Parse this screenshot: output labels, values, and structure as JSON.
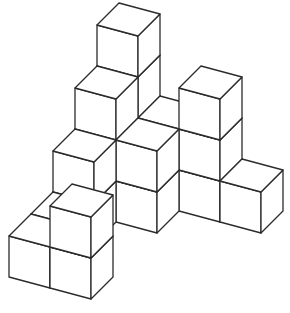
{
  "figure": {
    "title": "Isometric stack of unit cubes",
    "colors": {
      "face_fill": "#ffffff",
      "edge_stroke": "#2b2b2b",
      "background": "#ffffff"
    },
    "projection": {
      "origin": [
        9,
        277
      ],
      "ex": [
        41,
        11
      ],
      "ey": [
        22,
        -22
      ],
      "ez": [
        0,
        -41
      ]
    },
    "columns": [
      {
        "x": 0,
        "y": 4,
        "height": 4
      },
      {
        "x": 1,
        "y": 4,
        "height": 2
      },
      {
        "x": 2,
        "y": 4,
        "height": 3
      },
      {
        "x": 3,
        "y": 4,
        "height": 1
      },
      {
        "x": 0,
        "y": 3,
        "height": 3
      },
      {
        "x": 1,
        "y": 3,
        "height": 2
      },
      {
        "x": 0,
        "y": 2,
        "height": 2
      },
      {
        "x": 0,
        "y": 1,
        "height": 1
      },
      {
        "x": 0,
        "y": 0,
        "height": 1
      },
      {
        "x": 1,
        "y": 0,
        "height": 2
      }
    ],
    "cube_count": 21
  }
}
